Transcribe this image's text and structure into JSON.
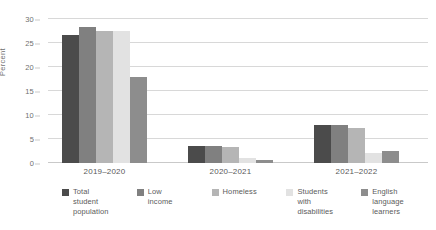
{
  "chart_data": {
    "type": "bar",
    "title": "",
    "xlabel": "",
    "ylabel": "Percent",
    "ylim": [
      0,
      30
    ],
    "yticks": [
      0,
      5,
      10,
      15,
      20,
      25,
      30
    ],
    "grid": true,
    "legend_position": "bottom",
    "categories": [
      "2019–2020",
      "2020–2021",
      "2021–2022"
    ],
    "series": [
      {
        "name": "Total student population",
        "name_lines": [
          "Total",
          "student",
          "population"
        ],
        "color": "#4b4b4b",
        "values": [
          26.6,
          3.5,
          8.0
        ]
      },
      {
        "name": "Low income",
        "name_lines": [
          "Low",
          "income"
        ],
        "color": "#808080",
        "values": [
          28.4,
          3.5,
          8.0
        ]
      },
      {
        "name": "Homeless",
        "name_lines": [
          "Homeless"
        ],
        "color": "#b5b5b5",
        "values": [
          27.6,
          3.4,
          7.2
        ]
      },
      {
        "name": "Students with disabilities",
        "name_lines": [
          "Students",
          "with",
          "disabilities"
        ],
        "color": "#e2e2e2",
        "values": [
          27.4,
          1.0,
          2.0
        ]
      },
      {
        "name": "English language learners",
        "name_lines": [
          "English",
          "language",
          "learners"
        ],
        "color": "#8d8d8d",
        "values": [
          18.0,
          0.7,
          2.5
        ]
      }
    ]
  },
  "axis": {
    "y_title": "Percent",
    "y_tick_labels": [
      "30",
      "25",
      "20",
      "15",
      "10",
      "5",
      "0"
    ]
  },
  "colors": {
    "gridline": "#d8d8d8",
    "baseline": "#c9c9c9",
    "text": "#5b5b5b",
    "tick_text": "#6f6f6f"
  }
}
